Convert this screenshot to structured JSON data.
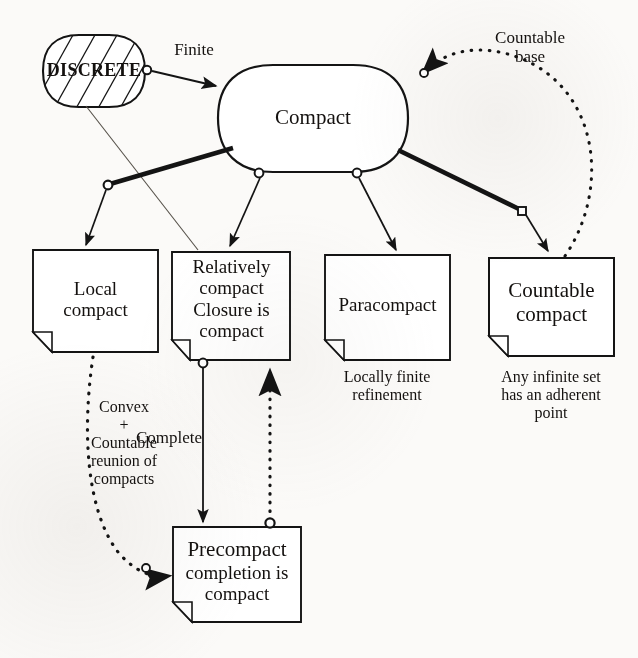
{
  "diagram": {
    "stroke_color": "#141414",
    "background_color": "#fbfaf8"
  },
  "nodes": {
    "discrete": {
      "label": "DISCRETE",
      "shape": "hatched-rounded-capsule"
    },
    "compact": {
      "label": "Compact",
      "shape": "rounded-rectangle"
    },
    "local_compact": {
      "lines": [
        "Local",
        "compact"
      ],
      "shape": "note"
    },
    "relatively_compact": {
      "lines": [
        "Relatively",
        "compact",
        "Closure is",
        "compact"
      ],
      "shape": "note"
    },
    "paracompact": {
      "lines": [
        "Paracompact"
      ],
      "shape": "note"
    },
    "countable_compact": {
      "lines": [
        "Countable",
        "compact"
      ],
      "shape": "note"
    },
    "precompact": {
      "lines": [
        "Precompact",
        "completion is",
        "compact"
      ],
      "shape": "note"
    }
  },
  "captions": {
    "paracompact_caption": [
      "Locally finite",
      "refinement"
    ],
    "countable_compact_caption": [
      "Any infinite set",
      "has an adherent",
      "point"
    ]
  },
  "edge_labels": {
    "finite": "Finite",
    "countable_base": [
      "Countable",
      "base"
    ],
    "complete": "Complete",
    "convex_countable_reunion": [
      "Convex",
      "+",
      "Countable",
      "reunion of",
      "compacts"
    ]
  },
  "edges": [
    {
      "from": "discrete",
      "to": "compact",
      "label": "Finite",
      "style": "solid",
      "arrow": true
    },
    {
      "from": "discrete",
      "to": "relatively_compact",
      "label": "",
      "style": "thin-solid",
      "arrow": false
    },
    {
      "from": "compact",
      "to": "local_compact",
      "label": "",
      "style": "thick-then-thin",
      "arrow": true
    },
    {
      "from": "compact",
      "to": "relatively_compact",
      "label": "",
      "style": "solid",
      "arrow": true
    },
    {
      "from": "compact",
      "to": "paracompact",
      "label": "",
      "style": "solid",
      "arrow": true
    },
    {
      "from": "compact",
      "to": "countable_compact",
      "label": "",
      "style": "thick-then-thin",
      "arrow": true
    },
    {
      "from": "countable_compact",
      "to": "compact",
      "label": "Countable base",
      "style": "dotted-curve",
      "arrow": true
    },
    {
      "from": "relatively_compact",
      "to": "precompact",
      "label": "Complete",
      "style": "solid",
      "arrow": true
    },
    {
      "from": "precompact",
      "to": "relatively_compact",
      "label": "",
      "style": "dotted",
      "arrow": true
    },
    {
      "from": "local_compact",
      "to": "precompact",
      "label": "Convex + Countable reunion of compacts",
      "style": "dotted-curve",
      "arrow": true
    }
  ]
}
